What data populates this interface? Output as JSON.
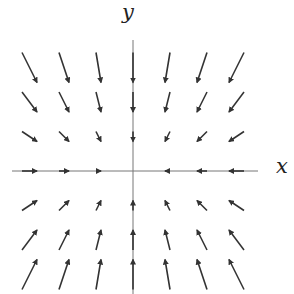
{
  "chart_data": {
    "type": "vector_field",
    "title": "",
    "xlabel": "x",
    "ylabel": "y",
    "field": "F(x,y) = (-x, -2y) (scaled)",
    "grid_x": [
      -3,
      -2,
      -1,
      0,
      1,
      2,
      3
    ],
    "grid_y": [
      -3,
      -2,
      -1,
      0,
      1,
      2,
      3
    ],
    "scale_px_per_unit": {
      "u": 5,
      "v": 10
    },
    "grid_on": false,
    "colors": {
      "axis": "#777777",
      "arrow": "#333333"
    }
  },
  "labels": {
    "x": "x",
    "y": "y"
  },
  "layout": {
    "origin_px": [
      133,
      171
    ],
    "spacing_px": 34.5,
    "x_axis_px": [
      12,
      258
    ],
    "y_axis_px": [
      40,
      294
    ]
  }
}
